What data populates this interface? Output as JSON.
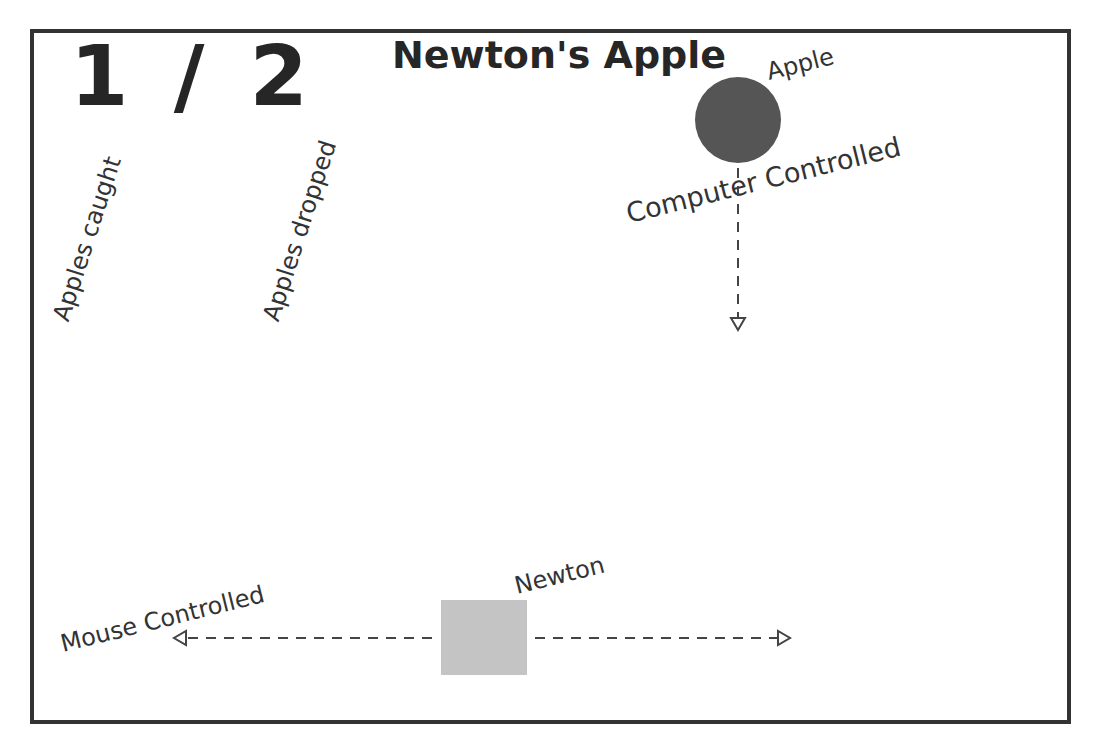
{
  "score": {
    "caught": "1",
    "separator": "/",
    "dropped": "2",
    "display": "1 / 2"
  },
  "title": "Newton's Apple",
  "labels": {
    "apples_caught": "Apples caught",
    "apples_dropped": "Apples dropped",
    "apple": "Apple",
    "computer_controlled": "Computer Controlled",
    "mouse_controlled": "Mouse  Controlled",
    "newton": "Newton"
  },
  "objects": {
    "apple": {
      "shape": "circle",
      "color": "#555555",
      "movement": "down"
    },
    "newton": {
      "shape": "square",
      "color": "#c4c4c4",
      "movement": "left-right"
    }
  },
  "colors": {
    "border": "#333333",
    "text": "#262626",
    "arrow": "#444444",
    "background": "#ffffff"
  }
}
